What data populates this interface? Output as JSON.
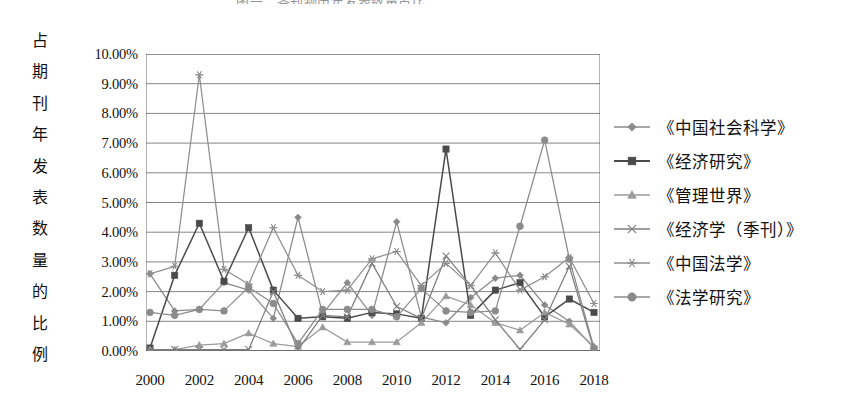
{
  "figure": {
    "title_fragment": "图一　各刊物历年发表数量占比",
    "y_axis_title_chars": [
      "占",
      "期",
      "刊",
      "年",
      "发",
      "表",
      "数",
      "量",
      "的",
      "比",
      "例"
    ]
  },
  "chart_data": {
    "type": "line",
    "title": "",
    "xlabel": "",
    "ylabel": "占期刊年发表数量的比例",
    "x": [
      2000,
      2001,
      2002,
      2003,
      2004,
      2005,
      2006,
      2007,
      2008,
      2009,
      2010,
      2011,
      2012,
      2013,
      2014,
      2015,
      2016,
      2017,
      2018
    ],
    "x_tick_labels": [
      "2000",
      "2002",
      "2004",
      "2006",
      "2008",
      "2010",
      "2012",
      "2014",
      "2016",
      "2018"
    ],
    "y_tick_labels": [
      "0.00%",
      "1.00%",
      "2.00%",
      "3.00%",
      "4.00%",
      "5.00%",
      "6.00%",
      "7.00%",
      "8.00%",
      "9.00%",
      "10.00%"
    ],
    "ylim": [
      0,
      10
    ],
    "yunit": "%",
    "grid": true,
    "legend_position": "right",
    "series": [
      {
        "name": "《中国社会科学》",
        "marker": "diamond",
        "color": "#8a8a8a",
        "values": [
          2.6,
          1.35,
          1.4,
          2.3,
          2.05,
          1.1,
          4.5,
          1.25,
          2.3,
          1.2,
          4.35,
          1.15,
          0.95,
          1.8,
          2.45,
          2.55,
          1.55,
          1.0,
          0.1
        ]
      },
      {
        "name": "《经济研究》",
        "marker": "square",
        "color": "#4a4a4a",
        "values": [
          0.1,
          2.55,
          4.3,
          2.35,
          4.15,
          2.05,
          1.1,
          1.15,
          1.1,
          1.3,
          1.25,
          1.1,
          6.8,
          1.2,
          2.05,
          2.3,
          1.15,
          1.75,
          1.3
        ]
      },
      {
        "name": "《管理世界》",
        "marker": "triangle",
        "color": "#9b9b9b",
        "values": [
          0.05,
          0.05,
          0.2,
          0.25,
          0.6,
          0.25,
          0.15,
          0.8,
          0.3,
          0.3,
          0.3,
          0.95,
          1.85,
          1.55,
          0.95,
          0.7,
          1.3,
          0.9,
          0.15
        ]
      },
      {
        "name": "《经济学（季刊）》",
        "marker": "x",
        "color": "#7d7d7d",
        "values": [
          0.05,
          0.05,
          0.05,
          0.05,
          0.05,
          2.0,
          0.05,
          1.2,
          1.15,
          2.95,
          1.5,
          1.1,
          3.2,
          2.2,
          1.05,
          0.05,
          1.05,
          2.85,
          0.05
        ]
      },
      {
        "name": "《中国法学》",
        "marker": "asterisk",
        "color": "#8f8f8f",
        "values": [
          2.6,
          2.85,
          9.3,
          2.75,
          2.25,
          4.15,
          2.55,
          2.0,
          2.05,
          3.1,
          3.35,
          2.2,
          2.95,
          2.2,
          3.3,
          2.05,
          2.5,
          3.15,
          1.6
        ]
      },
      {
        "name": "《法学研究》",
        "marker": "circle",
        "color": "#8b8b8b",
        "values": [
          1.3,
          1.2,
          1.4,
          1.35,
          2.15,
          1.6,
          0.25,
          1.4,
          1.4,
          1.4,
          1.15,
          2.1,
          1.35,
          1.3,
          1.35,
          4.2,
          7.1,
          3.1,
          0.1
        ]
      }
    ]
  }
}
